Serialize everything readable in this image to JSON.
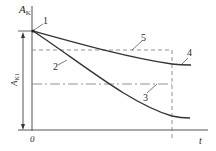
{
  "diagram": {
    "axis_labels": {
      "y": "A",
      "y_sub": "K",
      "x": "t",
      "origin": "0",
      "interval": "A",
      "interval_sub": "K1"
    },
    "curve_labels": [
      "1",
      "2",
      "3",
      "4",
      "5"
    ],
    "colors": {
      "line": "#333333",
      "dashed": "#666666"
    }
  }
}
